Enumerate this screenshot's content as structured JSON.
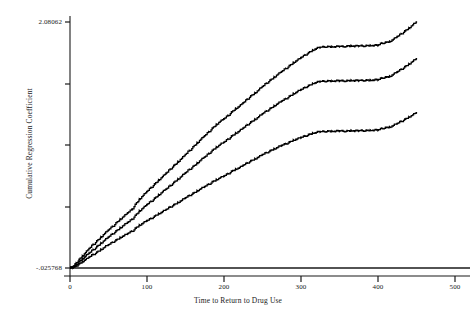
{
  "chart_data": {
    "type": "line",
    "title": "",
    "subtitle": "",
    "xlabel": "Time to Return to Drug Use",
    "ylabel": "Cumulative Regression Coefficient",
    "xlim": [
      0,
      500
    ],
    "ylim": [
      -0.025768,
      2.08062
    ],
    "grid": false,
    "legend_position": "none",
    "x_ticks": [
      {
        "value": 0,
        "label": "0",
        "px": 70
      },
      {
        "value": 100,
        "label": "100",
        "px": 147
      },
      {
        "value": 200,
        "label": "200",
        "px": 224
      },
      {
        "value": 300,
        "label": "300",
        "px": 301
      },
      {
        "value": 400,
        "label": "400",
        "px": 378
      },
      {
        "value": 500,
        "label": "500",
        "px": 455
      }
    ],
    "y_ticks": [
      {
        "value": 2.08062,
        "label": "2.08062",
        "px": 22
      },
      {
        "value": 1.556,
        "label": "",
        "px": 84
      },
      {
        "value": 1.029,
        "label": "",
        "px": 145
      },
      {
        "value": 0.502,
        "label": "",
        "px": 207
      },
      {
        "value": -0.025768,
        "label": "-.025768",
        "px": 268
      }
    ],
    "reference_line": {
      "y": -0.025768,
      "label": "zero-reference-line"
    },
    "series": [
      {
        "name": "upper-band",
        "color": "#000000",
        "points": [
          [
            0,
            -0.0258
          ],
          [
            4,
            -0.013
          ],
          [
            8,
            0.018
          ],
          [
            12,
            0.048
          ],
          [
            16,
            0.076
          ],
          [
            20,
            0.106
          ],
          [
            25,
            0.142
          ],
          [
            30,
            0.176
          ],
          [
            35,
            0.206
          ],
          [
            40,
            0.238
          ],
          [
            45,
            0.27
          ],
          [
            50,
            0.301
          ],
          [
            55,
            0.33
          ],
          [
            60,
            0.361
          ],
          [
            65,
            0.391
          ],
          [
            70,
            0.419
          ],
          [
            75,
            0.447
          ],
          [
            80,
            0.475
          ],
          [
            85,
            0.52
          ],
          [
            90,
            0.562
          ],
          [
            95,
            0.596
          ],
          [
            100,
            0.63
          ],
          [
            105,
            0.662
          ],
          [
            110,
            0.694
          ],
          [
            115,
            0.726
          ],
          [
            120,
            0.756
          ],
          [
            125,
            0.788
          ],
          [
            130,
            0.82
          ],
          [
            135,
            0.852
          ],
          [
            140,
            0.882
          ],
          [
            145,
            0.914
          ],
          [
            150,
            0.948
          ],
          [
            155,
            0.98
          ],
          [
            160,
            1.012
          ],
          [
            165,
            1.045
          ],
          [
            170,
            1.078
          ],
          [
            175,
            1.108
          ],
          [
            180,
            1.14
          ],
          [
            185,
            1.172
          ],
          [
            190,
            1.202
          ],
          [
            195,
            1.23
          ],
          [
            200,
            1.252
          ],
          [
            205,
            1.28
          ],
          [
            210,
            1.31
          ],
          [
            215,
            1.338
          ],
          [
            220,
            1.36
          ],
          [
            225,
            1.39
          ],
          [
            230,
            1.42
          ],
          [
            235,
            1.448
          ],
          [
            240,
            1.472
          ],
          [
            245,
            1.5
          ],
          [
            250,
            1.53
          ],
          [
            255,
            1.556
          ],
          [
            260,
            1.582
          ],
          [
            265,
            1.608
          ],
          [
            270,
            1.634
          ],
          [
            275,
            1.658
          ],
          [
            280,
            1.682
          ],
          [
            285,
            1.706
          ],
          [
            290,
            1.732
          ],
          [
            295,
            1.754
          ],
          [
            300,
            1.776
          ],
          [
            305,
            1.798
          ],
          [
            310,
            1.818
          ],
          [
            315,
            1.838
          ],
          [
            320,
            1.854
          ],
          [
            325,
            1.864
          ],
          [
            330,
            1.868
          ],
          [
            335,
            1.87
          ],
          [
            340,
            1.868
          ],
          [
            345,
            1.87
          ],
          [
            350,
            1.872
          ],
          [
            355,
            1.87
          ],
          [
            360,
            1.874
          ],
          [
            365,
            1.876
          ],
          [
            370,
            1.874
          ],
          [
            375,
            1.876
          ],
          [
            380,
            1.876
          ],
          [
            385,
            1.878
          ],
          [
            390,
            1.878
          ],
          [
            395,
            1.88
          ],
          [
            400,
            1.882
          ],
          [
            405,
            1.9
          ],
          [
            410,
            1.906
          ],
          [
            415,
            1.912
          ],
          [
            420,
            1.934
          ],
          [
            425,
            1.956
          ],
          [
            430,
            1.98
          ],
          [
            435,
            2.004
          ],
          [
            440,
            2.028
          ],
          [
            445,
            2.056
          ],
          [
            450,
            2.0806
          ]
        ]
      },
      {
        "name": "middle-band",
        "color": "#000000",
        "points": [
          [
            0,
            -0.0258
          ],
          [
            4,
            -0.018
          ],
          [
            8,
            0.004
          ],
          [
            12,
            0.028
          ],
          [
            16,
            0.052
          ],
          [
            20,
            0.076
          ],
          [
            25,
            0.104
          ],
          [
            30,
            0.132
          ],
          [
            35,
            0.158
          ],
          [
            40,
            0.186
          ],
          [
            45,
            0.214
          ],
          [
            50,
            0.24
          ],
          [
            55,
            0.266
          ],
          [
            60,
            0.292
          ],
          [
            65,
            0.318
          ],
          [
            70,
            0.342
          ],
          [
            75,
            0.366
          ],
          [
            80,
            0.39
          ],
          [
            85,
            0.426
          ],
          [
            90,
            0.462
          ],
          [
            95,
            0.49
          ],
          [
            100,
            0.518
          ],
          [
            105,
            0.544
          ],
          [
            110,
            0.572
          ],
          [
            115,
            0.6
          ],
          [
            120,
            0.626
          ],
          [
            125,
            0.652
          ],
          [
            130,
            0.68
          ],
          [
            135,
            0.708
          ],
          [
            140,
            0.734
          ],
          [
            145,
            0.762
          ],
          [
            150,
            0.79
          ],
          [
            155,
            0.818
          ],
          [
            160,
            0.844
          ],
          [
            165,
            0.872
          ],
          [
            170,
            0.9
          ],
          [
            175,
            0.926
          ],
          [
            180,
            0.954
          ],
          [
            185,
            0.982
          ],
          [
            190,
            1.008
          ],
          [
            195,
            1.032
          ],
          [
            200,
            1.052
          ],
          [
            205,
            1.078
          ],
          [
            210,
            1.104
          ],
          [
            215,
            1.128
          ],
          [
            220,
            1.148
          ],
          [
            225,
            1.174
          ],
          [
            230,
            1.2
          ],
          [
            235,
            1.224
          ],
          [
            240,
            1.246
          ],
          [
            245,
            1.27
          ],
          [
            250,
            1.296
          ],
          [
            255,
            1.318
          ],
          [
            260,
            1.34
          ],
          [
            265,
            1.362
          ],
          [
            270,
            1.384
          ],
          [
            275,
            1.404
          ],
          [
            280,
            1.424
          ],
          [
            285,
            1.444
          ],
          [
            290,
            1.466
          ],
          [
            295,
            1.484
          ],
          [
            300,
            1.502
          ],
          [
            305,
            1.52
          ],
          [
            310,
            1.536
          ],
          [
            315,
            1.552
          ],
          [
            320,
            1.564
          ],
          [
            325,
            1.572
          ],
          [
            330,
            1.574
          ],
          [
            335,
            1.576
          ],
          [
            340,
            1.574
          ],
          [
            345,
            1.576
          ],
          [
            350,
            1.578
          ],
          [
            355,
            1.576
          ],
          [
            360,
            1.578
          ],
          [
            365,
            1.58
          ],
          [
            370,
            1.578
          ],
          [
            375,
            1.58
          ],
          [
            380,
            1.58
          ],
          [
            385,
            1.582
          ],
          [
            390,
            1.582
          ],
          [
            395,
            1.584
          ],
          [
            400,
            1.586
          ],
          [
            405,
            1.602
          ],
          [
            410,
            1.608
          ],
          [
            415,
            1.614
          ],
          [
            420,
            1.634
          ],
          [
            425,
            1.654
          ],
          [
            430,
            1.676
          ],
          [
            435,
            1.698
          ],
          [
            440,
            1.72
          ],
          [
            445,
            1.744
          ],
          [
            450,
            1.766
          ]
        ]
      },
      {
        "name": "lower-band",
        "color": "#000000",
        "points": [
          [
            0,
            -0.0258
          ],
          [
            4,
            -0.022
          ],
          [
            8,
            -0.008
          ],
          [
            12,
            0.01
          ],
          [
            16,
            0.028
          ],
          [
            20,
            0.046
          ],
          [
            25,
            0.068
          ],
          [
            30,
            0.09
          ],
          [
            35,
            0.11
          ],
          [
            40,
            0.132
          ],
          [
            45,
            0.154
          ],
          [
            50,
            0.174
          ],
          [
            55,
            0.194
          ],
          [
            60,
            0.214
          ],
          [
            65,
            0.234
          ],
          [
            70,
            0.252
          ],
          [
            75,
            0.27
          ],
          [
            80,
            0.288
          ],
          [
            85,
            0.314
          ],
          [
            90,
            0.34
          ],
          [
            95,
            0.36
          ],
          [
            100,
            0.38
          ],
          [
            105,
            0.398
          ],
          [
            110,
            0.418
          ],
          [
            115,
            0.438
          ],
          [
            120,
            0.456
          ],
          [
            125,
            0.476
          ],
          [
            130,
            0.496
          ],
          [
            135,
            0.516
          ],
          [
            140,
            0.534
          ],
          [
            145,
            0.554
          ],
          [
            150,
            0.576
          ],
          [
            155,
            0.596
          ],
          [
            160,
            0.614
          ],
          [
            165,
            0.634
          ],
          [
            170,
            0.654
          ],
          [
            175,
            0.672
          ],
          [
            180,
            0.692
          ],
          [
            185,
            0.712
          ],
          [
            190,
            0.73
          ],
          [
            195,
            0.748
          ],
          [
            200,
            0.762
          ],
          [
            205,
            0.782
          ],
          [
            210,
            0.802
          ],
          [
            215,
            0.82
          ],
          [
            220,
            0.834
          ],
          [
            225,
            0.854
          ],
          [
            230,
            0.874
          ],
          [
            235,
            0.892
          ],
          [
            240,
            0.908
          ],
          [
            245,
            0.926
          ],
          [
            250,
            0.946
          ],
          [
            255,
            0.962
          ],
          [
            260,
            0.978
          ],
          [
            265,
            0.994
          ],
          [
            270,
            1.01
          ],
          [
            275,
            1.024
          ],
          [
            280,
            1.038
          ],
          [
            285,
            1.052
          ],
          [
            290,
            1.068
          ],
          [
            295,
            1.08
          ],
          [
            300,
            1.092
          ],
          [
            305,
            1.104
          ],
          [
            310,
            1.116
          ],
          [
            315,
            1.128
          ],
          [
            320,
            1.136
          ],
          [
            325,
            1.142
          ],
          [
            330,
            1.144
          ],
          [
            335,
            1.146
          ],
          [
            340,
            1.144
          ],
          [
            345,
            1.146
          ],
          [
            350,
            1.148
          ],
          [
            355,
            1.146
          ],
          [
            360,
            1.148
          ],
          [
            365,
            1.15
          ],
          [
            370,
            1.148
          ],
          [
            375,
            1.15
          ],
          [
            380,
            1.15
          ],
          [
            385,
            1.152
          ],
          [
            390,
            1.152
          ],
          [
            395,
            1.154
          ],
          [
            400,
            1.156
          ],
          [
            405,
            1.17
          ],
          [
            410,
            1.176
          ],
          [
            415,
            1.18
          ],
          [
            420,
            1.196
          ],
          [
            425,
            1.212
          ],
          [
            430,
            1.23
          ],
          [
            435,
            1.248
          ],
          [
            440,
            1.266
          ],
          [
            445,
            1.286
          ],
          [
            450,
            1.304
          ]
        ]
      }
    ]
  },
  "axes": {
    "y_top_label": "2.08062",
    "y_bottom_label": "-.025768",
    "x_labels": [
      "0",
      "100",
      "200",
      "300",
      "400",
      "500"
    ],
    "x_title": "Time to Return to Drug Use",
    "y_title": "Cumulative Regression Coefficient"
  },
  "style": {
    "line_color": "#000000",
    "axis_color": "#1a1a1a",
    "background": "#ffffff"
  }
}
